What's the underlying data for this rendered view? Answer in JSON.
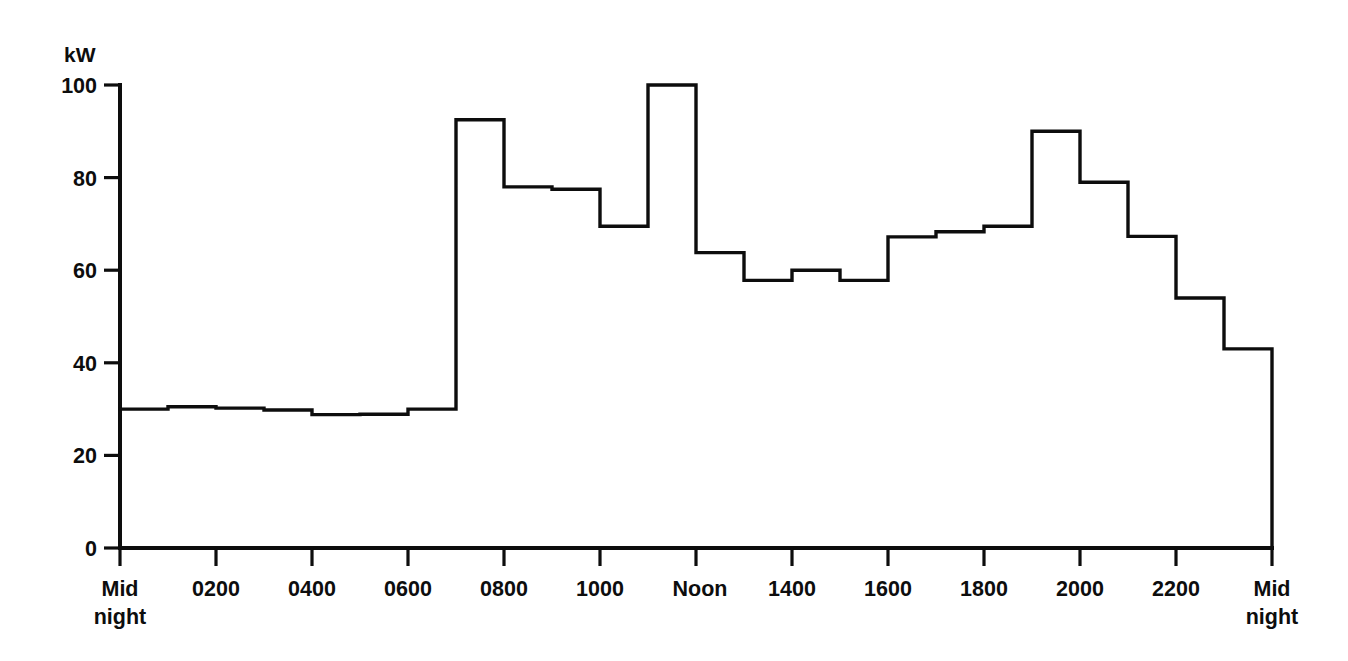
{
  "chart_data": {
    "type": "line",
    "subtype": "step-post",
    "title": "",
    "xlabel": "",
    "ylabel": "kW",
    "ylim": [
      0,
      100
    ],
    "xlim": [
      0,
      24
    ],
    "grid": false,
    "legend": "none",
    "y_ticks": [
      0,
      20,
      40,
      60,
      80,
      100
    ],
    "y_tick_labels": [
      "0",
      "20",
      "40",
      "60",
      "80",
      "100"
    ],
    "x_ticks": [
      0,
      2,
      4,
      6,
      8,
      10,
      12,
      14,
      16,
      18,
      20,
      22,
      24
    ],
    "x_tick_labels": [
      "Mid\nnight",
      "0200",
      "0400",
      "0600",
      "0800",
      "1000",
      "Noon",
      "1400",
      "1600",
      "1800",
      "2000",
      "2200",
      "Mid\nnight"
    ],
    "x_tick_label_lines": [
      [
        "Mid",
        "night"
      ],
      [
        "0200"
      ],
      [
        "0400"
      ],
      [
        "0600"
      ],
      [
        "0800"
      ],
      [
        "1000"
      ],
      [
        "Noon"
      ],
      [
        "1400"
      ],
      [
        "1600"
      ],
      [
        "1800"
      ],
      [
        "2000"
      ],
      [
        "2200"
      ],
      [
        "Mid",
        "night"
      ]
    ],
    "categories": [
      "0000-0100",
      "0100-0200",
      "0200-0300",
      "0300-0400",
      "0400-0500",
      "0500-0600",
      "0600-0700",
      "0700-0800",
      "0800-0900",
      "0900-1000",
      "1000-1100",
      "1100-1200",
      "1200-1300",
      "1300-1400",
      "1400-1500",
      "1500-1600",
      "1600-1700",
      "1700-1800",
      "1800-1900",
      "1900-2000",
      "2000-2100",
      "2100-2200",
      "2200-2300",
      "2300-2400"
    ],
    "values": [
      30.0,
      30.5,
      30.2,
      29.8,
      28.8,
      28.9,
      30.0,
      92.5,
      78.0,
      77.5,
      69.5,
      100.0,
      63.8,
      57.8,
      60.0,
      57.8,
      67.2,
      68.3,
      69.5,
      90.0,
      79.0,
      67.3,
      54.0,
      43.0
    ],
    "step_edges_hours": [
      0,
      1,
      2,
      3,
      4,
      5,
      6,
      7,
      8,
      9,
      10,
      11,
      12,
      13,
      14,
      15,
      16,
      17,
      18,
      19,
      20,
      21,
      22,
      23,
      24
    ],
    "step_levels_kw": [
      30.0,
      30.5,
      30.2,
      29.8,
      28.8,
      28.9,
      30.0,
      92.5,
      78.0,
      77.5,
      69.5,
      100.0,
      63.8,
      57.8,
      60.0,
      57.8,
      67.2,
      68.3,
      69.5,
      90.0,
      79.0,
      67.3,
      54.0,
      43.0,
      35.0
    ],
    "annotations": [],
    "units": "kW"
  },
  "axes": {
    "y_axis_unit_label": "kW"
  }
}
